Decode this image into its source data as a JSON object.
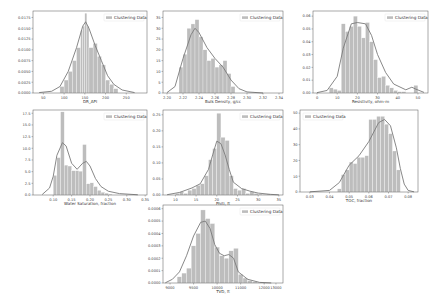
{
  "colors": {
    "bar": "#bdbdbd",
    "bar_edge": "#ffffff",
    "kde": "#7a7a7a",
    "frame": "#555555",
    "legend_patch": "#bdbdbd"
  },
  "legend_label": "Clustering Data",
  "chart_data": [
    {
      "type": "bar",
      "title": "",
      "xlabel": "DR_API",
      "ylabel": "",
      "xlim": [
        25,
        300
      ],
      "ylim": [
        0,
        0.019
      ],
      "xticks": [
        50,
        100,
        150,
        200,
        250
      ],
      "yticks": [
        0.0,
        0.0025,
        0.005,
        0.0075,
        0.01,
        0.0125,
        0.015,
        0.0175
      ],
      "ytick_labels": [
        "0.0000",
        "0.0025",
        "0.0050",
        "0.0075",
        "0.0100",
        "0.0125",
        "0.0150",
        "0.0175"
      ],
      "legend": [
        "Clustering Data"
      ],
      "legend_position": "upper right",
      "bins": [
        90,
        100,
        110,
        120,
        130,
        140,
        145,
        150,
        155,
        160,
        170,
        180,
        190,
        200,
        210,
        220,
        230
      ],
      "values": [
        0.0015,
        0.003,
        0.005,
        0.0075,
        0.0105,
        0.0145,
        0.0155,
        0.0185,
        0.0155,
        0.0105,
        0.0115,
        0.0085,
        0.0065,
        0.003,
        0.002,
        0.001
      ],
      "kde": [
        [
          40,
          0.0001
        ],
        [
          70,
          0.0004
        ],
        [
          90,
          0.0015
        ],
        [
          110,
          0.005
        ],
        [
          130,
          0.0105
        ],
        [
          145,
          0.0155
        ],
        [
          152,
          0.0165
        ],
        [
          160,
          0.015
        ],
        [
          175,
          0.011
        ],
        [
          190,
          0.0075
        ],
        [
          205,
          0.004
        ],
        [
          220,
          0.002
        ],
        [
          240,
          0.0007
        ],
        [
          270,
          0.0001
        ]
      ]
    },
    {
      "type": "bar",
      "title": "",
      "xlabel": "Bulk Density, g/cc",
      "ylabel": "",
      "xlim": [
        2.195,
        2.345
      ],
      "ylim": [
        0,
        38
      ],
      "xticks": [
        2.2,
        2.22,
        2.24,
        2.26,
        2.28,
        2.3,
        2.32,
        2.34
      ],
      "xtick_labels": [
        "2.20",
        "2.22",
        "2.24",
        "2.26",
        "2.28",
        "2.30",
        "2.32",
        "2.34"
      ],
      "yticks": [
        0,
        5,
        10,
        15,
        20,
        25,
        30,
        35
      ],
      "legend": [
        "Clustering Data"
      ],
      "legend_position": "upper right",
      "bins": [
        2.215,
        2.22,
        2.225,
        2.23,
        2.235,
        2.24,
        2.245,
        2.25,
        2.255,
        2.26,
        2.265,
        2.27,
        2.275,
        2.28,
        2.285
      ],
      "values": [
        12,
        18,
        30,
        32,
        34,
        26,
        20,
        15,
        16,
        12,
        13,
        15,
        9,
        3
      ],
      "kde": [
        [
          2.2,
          0.2
        ],
        [
          2.21,
          3
        ],
        [
          2.22,
          16
        ],
        [
          2.23,
          27
        ],
        [
          2.235,
          30
        ],
        [
          2.24,
          28
        ],
        [
          2.25,
          21
        ],
        [
          2.26,
          16
        ],
        [
          2.27,
          12
        ],
        [
          2.28,
          6
        ],
        [
          2.29,
          2
        ],
        [
          2.3,
          0.5
        ],
        [
          2.32,
          0
        ]
      ]
    },
    {
      "type": "bar",
      "title": "",
      "xlabel": "Resistivity, ohm-m",
      "ylabel": "",
      "xlim": [
        -2,
        55
      ],
      "ylim": [
        0,
        0.064
      ],
      "xticks": [
        0,
        10,
        20,
        30,
        40,
        50
      ],
      "yticks": [
        0.0,
        0.01,
        0.02,
        0.03,
        0.04,
        0.05,
        0.06
      ],
      "ytick_labels": [
        "0.00",
        "0.01",
        "0.02",
        "0.03",
        "0.04",
        "0.05",
        "0.06"
      ],
      "legend": [
        "Clustering Data"
      ],
      "legend_position": "upper right",
      "bins": [
        6,
        8,
        10,
        12,
        14,
        16,
        18,
        20,
        22,
        24,
        26,
        28,
        30,
        32,
        34,
        36,
        38,
        40,
        42,
        44,
        46,
        48,
        50
      ],
      "values": [
        0.004,
        0.003,
        0.002,
        0.054,
        0.048,
        0.052,
        0.06,
        0.052,
        0.043,
        0.055,
        0.04,
        0.026,
        0.012,
        0.013,
        0.006,
        0.004,
        0.002,
        0.001,
        0.001,
        0,
        0,
        0.006
      ],
      "kde": [
        [
          0,
          0.0003
        ],
        [
          5,
          0.002
        ],
        [
          10,
          0.013
        ],
        [
          13,
          0.035
        ],
        [
          17,
          0.054
        ],
        [
          20,
          0.055
        ],
        [
          24,
          0.054
        ],
        [
          27,
          0.045
        ],
        [
          30,
          0.03
        ],
        [
          34,
          0.016
        ],
        [
          38,
          0.007
        ],
        [
          44,
          0.0025
        ],
        [
          47,
          0.0045
        ],
        [
          49,
          0.003
        ],
        [
          53,
          0.0005
        ]
      ]
    },
    {
      "type": "bar",
      "title": "",
      "xlabel": "Water Saturation, fraction",
      "ylabel": "",
      "xlim": [
        0.045,
        0.355
      ],
      "ylim": [
        0,
        18.2
      ],
      "xticks": [
        0.1,
        0.15,
        0.2,
        0.25,
        0.3,
        0.35
      ],
      "xtick_labels": [
        "0.10",
        "0.15",
        "0.20",
        "0.25",
        "0.30",
        "0.35"
      ],
      "yticks": [
        0.0,
        2.5,
        5.0,
        7.5,
        10.0,
        12.5,
        15.0,
        17.5
      ],
      "ytick_labels": [
        "0.0",
        "2.5",
        "5.0",
        "7.5",
        "10.0",
        "12.5",
        "15.0",
        "17.5"
      ],
      "legend": [
        "Clustering Data"
      ],
      "legend_position": "upper right",
      "bins": [
        0.1,
        0.11,
        0.12,
        0.13,
        0.14,
        0.15,
        0.16,
        0.17,
        0.18,
        0.19,
        0.2,
        0.21,
        0.22,
        0.23,
        0.24,
        0.25,
        0.26
      ],
      "values": [
        4.2,
        8.0,
        17.8,
        6.4,
        6.2,
        5.2,
        5.2,
        5.1,
        10.8,
        2.4,
        2.6,
        1.8,
        1.0,
        0.6,
        0.4,
        0.2
      ],
      "kde": [
        [
          0.07,
          0.1
        ],
        [
          0.09,
          1.5
        ],
        [
          0.1,
          4
        ],
        [
          0.11,
          8.5
        ],
        [
          0.125,
          11.2
        ],
        [
          0.135,
          10.5
        ],
        [
          0.15,
          6.8
        ],
        [
          0.165,
          5.5
        ],
        [
          0.18,
          6.8
        ],
        [
          0.19,
          7.2
        ],
        [
          0.2,
          6.2
        ],
        [
          0.215,
          3.5
        ],
        [
          0.23,
          1.8
        ],
        [
          0.25,
          0.8
        ],
        [
          0.28,
          0.3
        ],
        [
          0.33,
          0.05
        ]
      ]
    },
    {
      "type": "bar",
      "title": "",
      "xlabel": "Phiti, ft",
      "ylabel": "",
      "xlim": [
        7,
        36
      ],
      "ylim": [
        0,
        0.265
      ],
      "xticks": [
        10,
        15,
        20,
        25,
        30,
        35
      ],
      "yticks": [
        0.0,
        0.05,
        0.1,
        0.15,
        0.2,
        0.25
      ],
      "ytick_labels": [
        "0.00",
        "0.05",
        "0.10",
        "0.15",
        "0.20",
        "0.25"
      ],
      "legend": [
        "Clustering Data"
      ],
      "legend_position": "upper right",
      "bins": [
        10,
        11,
        12,
        13,
        14,
        15,
        16,
        17,
        18,
        19,
        20,
        21,
        22,
        23,
        24,
        25,
        26,
        27,
        28,
        29,
        30,
        31,
        32,
        33
      ],
      "values": [
        0.005,
        0.01,
        0.005,
        0.015,
        0.02,
        0.03,
        0.035,
        0.06,
        0.11,
        0.145,
        0.255,
        0.18,
        0.17,
        0.06,
        0.02,
        0.015,
        0.02,
        0.005,
        0.01,
        0.005,
        0.003,
        0.002,
        0.003
      ],
      "kde": [
        [
          8,
          0.001
        ],
        [
          11,
          0.008
        ],
        [
          14,
          0.022
        ],
        [
          16,
          0.035
        ],
        [
          18,
          0.08
        ],
        [
          19,
          0.125
        ],
        [
          20,
          0.168
        ],
        [
          21,
          0.16
        ],
        [
          22,
          0.125
        ],
        [
          23,
          0.08
        ],
        [
          24,
          0.04
        ],
        [
          26,
          0.02
        ],
        [
          28,
          0.012
        ],
        [
          30,
          0.006
        ],
        [
          33,
          0.002
        ],
        [
          35,
          0.0005
        ]
      ]
    },
    {
      "type": "bar",
      "title": "",
      "xlabel": "TOC, fraction",
      "ylabel": "",
      "xlim": [
        0.025,
        0.085
      ],
      "ylim": [
        0,
        52
      ],
      "xticks": [
        0.03,
        0.04,
        0.05,
        0.06,
        0.07,
        0.08
      ],
      "xtick_labels": [
        "0.03",
        "0.04",
        "0.05",
        "0.06",
        "0.07",
        "0.08"
      ],
      "yticks": [
        0,
        10,
        20,
        30,
        40,
        50
      ],
      "legend": [
        "Clustering Data"
      ],
      "legend_position": "upper left",
      "bins": [
        0.044,
        0.046,
        0.048,
        0.05,
        0.052,
        0.054,
        0.056,
        0.058,
        0.06,
        0.062,
        0.064,
        0.066,
        0.068,
        0.07,
        0.072,
        0.074,
        0.076
      ],
      "values": [
        2,
        11,
        14,
        19,
        18,
        22,
        22,
        23,
        46,
        46,
        48,
        48,
        43,
        37,
        26,
        14
      ],
      "kde": [
        [
          0.03,
          0.1
        ],
        [
          0.04,
          1
        ],
        [
          0.045,
          6
        ],
        [
          0.05,
          17
        ],
        [
          0.055,
          23
        ],
        [
          0.06,
          32
        ],
        [
          0.065,
          44
        ],
        [
          0.068,
          46
        ],
        [
          0.071,
          42
        ],
        [
          0.074,
          28
        ],
        [
          0.076,
          15
        ],
        [
          0.078,
          5
        ],
        [
          0.08,
          1
        ],
        [
          0.083,
          0.1
        ]
      ]
    },
    {
      "type": "bar",
      "title": "",
      "xlabel": "TVD, ft",
      "ylabel": "",
      "xlim": [
        8200,
        13300
      ],
      "ylim": [
        0,
        0.00063
      ],
      "xticks": [
        8500,
        9500,
        10500,
        11500,
        12500,
        13000
      ],
      "xtick_labels": [
        "9000",
        "9500",
        "10000",
        "11000",
        "12000",
        "13000"
      ],
      "yticks": [
        0.0,
        0.0001,
        0.0002,
        0.0003,
        0.0004,
        0.0005,
        0.0006
      ],
      "ytick_labels": [
        "0.0000",
        "0.0001",
        "0.0002",
        "0.0003",
        "0.0004",
        "0.0005",
        "0.0006"
      ],
      "legend": [
        "Clustering Data"
      ],
      "legend_position": "upper right",
      "bins": [
        8800,
        9000,
        9200,
        9400,
        9600,
        9800,
        10000,
        10200,
        10400,
        10600,
        10800,
        11000,
        11200,
        11400,
        11600,
        11800,
        12000,
        12200
      ],
      "values": [
        5e-05,
        8e-05,
        0.00012,
        0.0003,
        0.0004,
        0.00059,
        0.00052,
        0.00048,
        0.00029,
        0.00022,
        0.0002,
        0.00026,
        0.00028,
        7e-05,
        4e-05,
        2e-05,
        1e-05
      ],
      "kde": [
        [
          8300,
          2e-06
        ],
        [
          8600,
          3e-05
        ],
        [
          8900,
          9e-05
        ],
        [
          9200,
          0.00022
        ],
        [
          9500,
          0.00038
        ],
        [
          9800,
          0.00049
        ],
        [
          10000,
          0.0005
        ],
        [
          10200,
          0.00044
        ],
        [
          10400,
          0.00031
        ],
        [
          10600,
          0.00024
        ],
        [
          10800,
          0.00022
        ],
        [
          11000,
          0.00023
        ],
        [
          11200,
          0.0002
        ],
        [
          11400,
          9e-05
        ],
        [
          11800,
          3e-05
        ],
        [
          12300,
          5e-06
        ],
        [
          12800,
          5e-07
        ]
      ]
    }
  ],
  "subplots": [
    {
      "id": "dr-api",
      "xlabel": "DR_API"
    },
    {
      "id": "bulk-density",
      "xlabel": "Bulk Density, g/cc"
    },
    {
      "id": "resistivity",
      "xlabel": "Resistivity, ohm-m"
    },
    {
      "id": "water-saturation",
      "xlabel": "Water Saturation, fraction"
    },
    {
      "id": "phiti",
      "xlabel": "Phiti, ft"
    },
    {
      "id": "toc",
      "xlabel": "TOC, fraction"
    },
    {
      "id": "tvd",
      "xlabel": "TVD, ft"
    }
  ]
}
